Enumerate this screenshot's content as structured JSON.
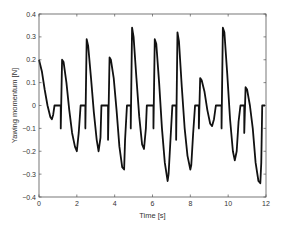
{
  "chart_data": {
    "type": "line",
    "title": "",
    "xlabel": "Time [s]",
    "ylabel": "Yawing momentum [N]",
    "xlim": [
      0,
      12
    ],
    "ylim": [
      -0.4,
      0.4
    ],
    "xticks": [
      0,
      2,
      4,
      6,
      8,
      10,
      12
    ],
    "xtick_labels": [
      "0",
      "2",
      "4",
      "6",
      "8",
      "10",
      "12"
    ],
    "yticks": [
      -0.4,
      -0.3,
      -0.2,
      -0.1,
      0,
      0.1,
      0.2,
      0.3,
      0.4
    ],
    "ytick_labels": [
      "-0.4",
      "-0.3",
      "-0.2",
      "-0.1",
      "0",
      "0.1",
      "0.2",
      "0.3",
      "0.4"
    ],
    "grid": false,
    "legend": null,
    "line_color": "#111111",
    "series": [
      {
        "name": "Yawing momentum",
        "x": [
          0,
          0.15,
          0.3,
          0.45,
          0.6,
          0.68,
          0.75,
          0.82,
          0.9,
          1.0,
          1.15,
          1.15,
          1.22,
          1.3,
          1.45,
          1.6,
          1.75,
          1.9,
          2.0,
          2.1,
          2.2,
          2.25,
          2.45,
          2.45,
          2.52,
          2.6,
          2.75,
          2.9,
          3.05,
          3.15,
          3.25,
          3.3,
          3.45,
          3.65,
          3.65,
          3.73,
          3.8,
          3.95,
          4.1,
          4.25,
          4.4,
          4.5,
          4.55,
          4.65,
          4.8,
          4.85,
          4.85,
          4.92,
          5.0,
          5.15,
          5.3,
          5.45,
          5.55,
          5.65,
          5.7,
          5.85,
          6.05,
          6.05,
          6.12,
          6.2,
          6.35,
          6.5,
          6.65,
          6.8,
          6.85,
          6.95,
          7.05,
          7.25,
          7.25,
          7.32,
          7.4,
          7.55,
          7.7,
          7.85,
          8.0,
          8.05,
          8.15,
          8.25,
          8.45,
          8.45,
          8.52,
          8.6,
          8.75,
          8.9,
          9.05,
          9.15,
          9.25,
          9.35,
          9.45,
          9.65,
          9.65,
          9.72,
          9.8,
          9.95,
          10.1,
          10.25,
          10.35,
          10.45,
          10.55,
          10.65,
          10.85,
          10.85,
          10.92,
          11.0,
          11.15,
          11.3,
          11.45,
          11.6,
          11.7,
          11.75,
          11.8,
          11.95
        ],
        "y": [
          0.2,
          0.15,
          0.07,
          0.0,
          -0.05,
          -0.06,
          -0.04,
          0.0,
          0.0,
          0.0,
          0.0,
          -0.1,
          0.2,
          0.19,
          0.1,
          -0.02,
          -0.12,
          -0.18,
          -0.2,
          -0.12,
          0.0,
          0.0,
          0.0,
          -0.1,
          0.29,
          0.26,
          0.12,
          -0.03,
          -0.15,
          -0.2,
          -0.14,
          0.0,
          0.0,
          0.0,
          -0.15,
          0.21,
          0.2,
          0.12,
          -0.02,
          -0.18,
          -0.27,
          -0.28,
          -0.15,
          0.0,
          0.0,
          0.0,
          -0.1,
          0.34,
          0.3,
          0.12,
          -0.05,
          -0.17,
          -0.19,
          -0.1,
          0.0,
          0.0,
          0.0,
          -0.1,
          0.29,
          0.27,
          0.1,
          -0.1,
          -0.25,
          -0.33,
          -0.3,
          -0.15,
          0.0,
          0.0,
          -0.15,
          0.32,
          0.28,
          0.08,
          -0.1,
          -0.22,
          -0.28,
          -0.26,
          -0.12,
          0.0,
          0.0,
          -0.1,
          0.12,
          0.11,
          0.06,
          -0.02,
          -0.08,
          -0.09,
          -0.06,
          0.0,
          0.0,
          0.0,
          -0.1,
          0.34,
          0.32,
          0.14,
          -0.06,
          -0.2,
          -0.24,
          -0.2,
          -0.07,
          0.0,
          0.0,
          -0.12,
          0.08,
          0.07,
          0.0,
          -0.1,
          -0.25,
          -0.33,
          -0.34,
          -0.25,
          0.0,
          0.0
        ]
      }
    ]
  },
  "plot": {
    "xlabel": "Time [s]",
    "ylabel": "Yawing momentum [N]"
  }
}
